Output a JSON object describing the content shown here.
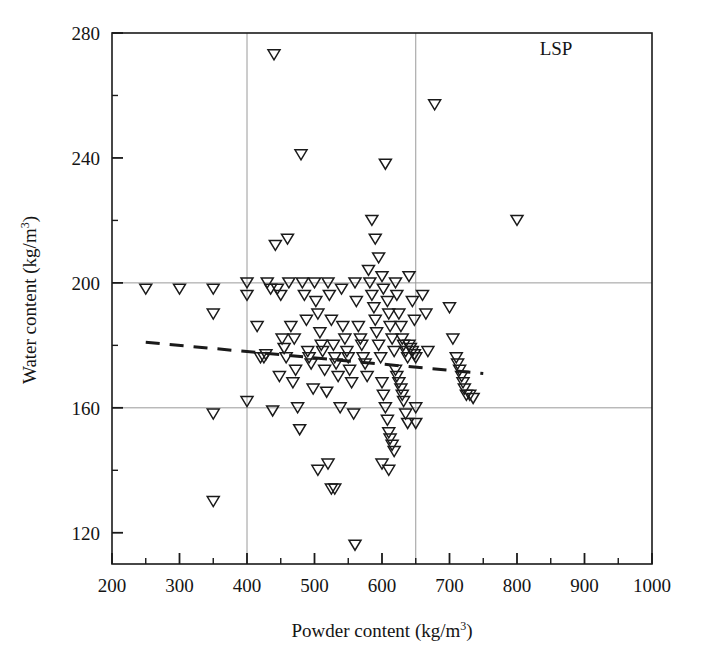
{
  "figure": {
    "annotation": "LSP",
    "background_color": "#ffffff",
    "frame_color": "#1a1a1a",
    "gridline_color": "#9a9a9a",
    "marker_color": "#1a1a1a",
    "trendline_color": "#1a1a1a"
  },
  "chart_data": {
    "type": "scatter",
    "title": "",
    "subtitle": "",
    "annotation": "LSP",
    "xlabel": "Powder content (kg/m3)",
    "xlabel_base": "Powder content (kg/m",
    "xlabel_sup": "3",
    "xlabel_tail": ")",
    "ylabel": "Water content (kg/m3)",
    "ylabel_base": "Water content (kg/m",
    "ylabel_sup": "3",
    "ylabel_tail": ")",
    "xlim": [
      200,
      1000
    ],
    "ylim": [
      110,
      280
    ],
    "xticks": [
      200,
      300,
      400,
      500,
      600,
      700,
      800,
      900,
      1000
    ],
    "xtick_labels": [
      "200",
      "300",
      "400",
      "500",
      "600",
      "700",
      "800",
      "900",
      "1000"
    ],
    "xminor_ticks": [
      250,
      350,
      450,
      550,
      650,
      750,
      850,
      950
    ],
    "yticks": [
      120,
      160,
      200,
      240,
      280
    ],
    "ytick_labels": [
      "120",
      "160",
      "200",
      "240",
      "280"
    ],
    "yminor_ticks": [
      140,
      180,
      220,
      260
    ],
    "grid": true,
    "gridlines_x": [
      400,
      650
    ],
    "gridlines_y": [
      160,
      200
    ],
    "legend": "none",
    "marker": "triangle-down-open",
    "series": [
      {
        "name": "LSP mixtures",
        "points": [
          [
            250,
            198
          ],
          [
            300,
            198
          ],
          [
            350,
            198
          ],
          [
            350,
            190
          ],
          [
            350,
            158
          ],
          [
            350,
            130
          ],
          [
            400,
            200
          ],
          [
            400,
            196
          ],
          [
            400,
            162
          ],
          [
            415,
            186
          ],
          [
            420,
            176
          ],
          [
            425,
            176
          ],
          [
            428,
            177
          ],
          [
            430,
            200
          ],
          [
            435,
            198
          ],
          [
            438,
            159
          ],
          [
            440,
            273
          ],
          [
            442,
            212
          ],
          [
            445,
            198
          ],
          [
            448,
            170
          ],
          [
            450,
            196
          ],
          [
            452,
            182
          ],
          [
            455,
            179
          ],
          [
            458,
            176
          ],
          [
            460,
            214
          ],
          [
            462,
            200
          ],
          [
            465,
            186
          ],
          [
            468,
            168
          ],
          [
            470,
            182
          ],
          [
            472,
            172
          ],
          [
            475,
            160
          ],
          [
            478,
            153
          ],
          [
            480,
            241
          ],
          [
            482,
            200
          ],
          [
            485,
            196
          ],
          [
            488,
            188
          ],
          [
            490,
            178
          ],
          [
            492,
            176
          ],
          [
            495,
            174
          ],
          [
            498,
            166
          ],
          [
            500,
            200
          ],
          [
            502,
            194
          ],
          [
            505,
            190
          ],
          [
            508,
            184
          ],
          [
            510,
            180
          ],
          [
            512,
            178
          ],
          [
            515,
            172
          ],
          [
            518,
            165
          ],
          [
            520,
            200
          ],
          [
            522,
            196
          ],
          [
            525,
            188
          ],
          [
            528,
            180
          ],
          [
            530,
            176
          ],
          [
            532,
            174
          ],
          [
            535,
            170
          ],
          [
            538,
            160
          ],
          [
            540,
            198
          ],
          [
            542,
            186
          ],
          [
            545,
            182
          ],
          [
            548,
            178
          ],
          [
            550,
            176
          ],
          [
            552,
            172
          ],
          [
            555,
            168
          ],
          [
            558,
            158
          ],
          [
            505,
            140
          ],
          [
            520,
            142
          ],
          [
            525,
            134
          ],
          [
            530,
            134
          ],
          [
            560,
            200
          ],
          [
            562,
            194
          ],
          [
            565,
            186
          ],
          [
            568,
            182
          ],
          [
            570,
            180
          ],
          [
            572,
            176
          ],
          [
            575,
            174
          ],
          [
            578,
            170
          ],
          [
            560,
            116
          ],
          [
            580,
            204
          ],
          [
            582,
            200
          ],
          [
            585,
            196
          ],
          [
            588,
            192
          ],
          [
            590,
            188
          ],
          [
            592,
            184
          ],
          [
            595,
            180
          ],
          [
            598,
            176
          ],
          [
            585,
            220
          ],
          [
            590,
            214
          ],
          [
            595,
            208
          ],
          [
            600,
            202
          ],
          [
            602,
            198
          ],
          [
            605,
            238
          ],
          [
            608,
            194
          ],
          [
            610,
            190
          ],
          [
            612,
            186
          ],
          [
            615,
            182
          ],
          [
            618,
            178
          ],
          [
            600,
            168
          ],
          [
            602,
            164
          ],
          [
            605,
            160
          ],
          [
            608,
            156
          ],
          [
            610,
            152
          ],
          [
            612,
            150
          ],
          [
            615,
            148
          ],
          [
            618,
            146
          ],
          [
            600,
            142
          ],
          [
            610,
            140
          ],
          [
            620,
            200
          ],
          [
            622,
            196
          ],
          [
            625,
            190
          ],
          [
            628,
            186
          ],
          [
            630,
            182
          ],
          [
            632,
            180
          ],
          [
            635,
            178
          ],
          [
            638,
            176
          ],
          [
            620,
            172
          ],
          [
            622,
            170
          ],
          [
            625,
            168
          ],
          [
            628,
            166
          ],
          [
            630,
            164
          ],
          [
            632,
            162
          ],
          [
            635,
            158
          ],
          [
            638,
            155
          ],
          [
            640,
            180
          ],
          [
            642,
            179
          ],
          [
            645,
            178
          ],
          [
            648,
            177
          ],
          [
            640,
            202
          ],
          [
            645,
            194
          ],
          [
            648,
            188
          ],
          [
            650,
            176
          ],
          [
            650,
            160
          ],
          [
            650,
            155
          ],
          [
            660,
            196
          ],
          [
            665,
            190
          ],
          [
            668,
            178
          ],
          [
            678,
            257
          ],
          [
            700,
            192
          ],
          [
            705,
            182
          ],
          [
            710,
            176
          ],
          [
            712,
            174
          ],
          [
            715,
            172
          ],
          [
            718,
            170
          ],
          [
            720,
            168
          ],
          [
            722,
            166
          ],
          [
            725,
            164
          ],
          [
            730,
            164
          ],
          [
            735,
            163
          ],
          [
            800,
            220
          ]
        ]
      }
    ],
    "trendline": {
      "label": "linear fit",
      "style": "dashed",
      "x_start": 250,
      "y_start": 181,
      "x_end": 750,
      "y_end": 171
    }
  }
}
